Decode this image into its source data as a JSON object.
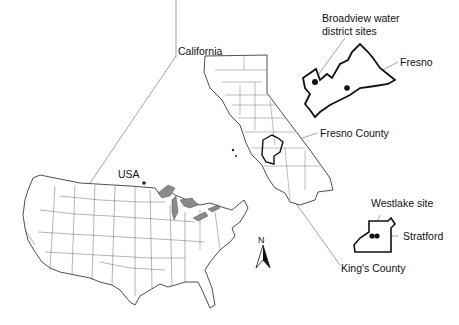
{
  "figure": {
    "type": "location map",
    "labels": {
      "california": "California",
      "usa": "USA",
      "broadview_line1": "Broadview water",
      "broadview_line2": "district sites",
      "fresno": "Fresno",
      "fresno_county": "Fresno County",
      "westlake": "Westlake site",
      "stratford": "Stratford",
      "kings_county": "King's County",
      "north": "N"
    },
    "colors": {
      "outline": "#222222",
      "thin_line": "#555555",
      "great_lakes": "#8a8a8a",
      "background": "#ffffff"
    }
  }
}
